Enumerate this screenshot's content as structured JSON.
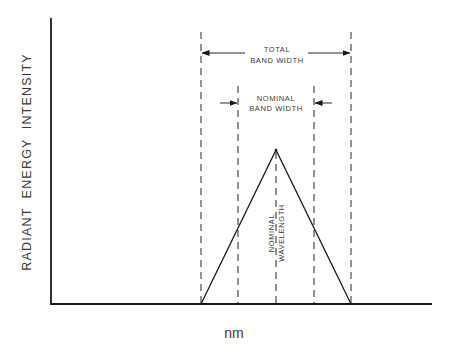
{
  "diagram": {
    "type": "bandwidth-diagram",
    "y_axis_label": "RADIANT  ENERGY  INTENSITY",
    "x_axis_label": "nm",
    "total_band_width": {
      "line1": "TOTAL",
      "line2": "BAND WIDTH"
    },
    "nominal_band_width": {
      "line1": "NOMINAL",
      "line2": "BAND  WIDTH"
    },
    "nominal_wavelength": {
      "line1": "NOMINAL",
      "line2": "WAVELENGTH"
    },
    "colors": {
      "ink": "#1a1a1a",
      "text": "#3a3a3a",
      "background": "#ffffff"
    },
    "geometry": {
      "origin": [
        51,
        304
      ],
      "y_axis_top": 18,
      "x_axis_right": 432,
      "peak": [
        276,
        150
      ],
      "base_left": 201,
      "base_right": 351,
      "dashed_lines_x": [
        201,
        238,
        276,
        314,
        351
      ],
      "total_arrow_y": 53,
      "nominal_arrow_y": 103
    }
  }
}
